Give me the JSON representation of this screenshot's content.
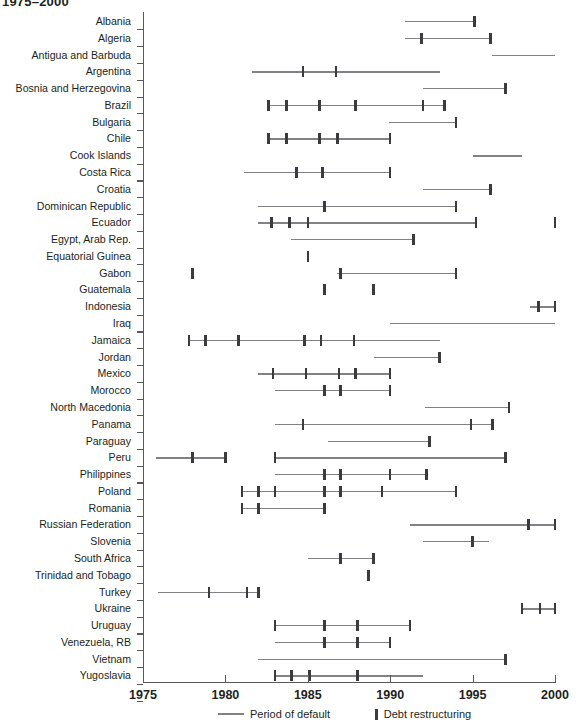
{
  "chart_title": "1975–2000",
  "legend": {
    "period_label": "Period of default",
    "restructuring_label": "Debt restructuring",
    "period_color": "#808285",
    "restructuring_color": "#3b3b3d"
  },
  "axis": {
    "x_label": "",
    "y_label": "",
    "x_ticks": [
      "1975",
      "1980",
      "1985",
      "1990",
      "1995",
      "2000"
    ],
    "x_min": 1975,
    "x_max": 2000
  },
  "chart_data": {
    "type": "timeline",
    "title": "1975–2000",
    "xlabel": "",
    "ylabel": "",
    "xlim": [
      1975,
      2000
    ],
    "grid": false,
    "legend_position": "bottom",
    "series": [
      {
        "name": "Period of default",
        "style": "line",
        "color": "#808285"
      },
      {
        "name": "Debt restructuring",
        "style": "marker",
        "color": "#3b3b3d"
      }
    ],
    "categories": [
      "Albania",
      "Algeria",
      "Antigua and Barbuda",
      "Argentina",
      "Bosnia and Herzegovina",
      "Brazil",
      "Bulgaria",
      "Chile",
      "Cook Islands",
      "Costa Rica",
      "Croatia",
      "Dominican Republic",
      "Ecuador",
      "Egypt, Arab Rep.",
      "Equatorial Guinea",
      "Gabon",
      "Guatemala",
      "Indonesia",
      "Iraq",
      "Jamaica",
      "Jordan",
      "Mexico",
      "Morocco",
      "North Macedonia",
      "Panama",
      "Paraguay",
      "Peru",
      "Philippines",
      "Poland",
      "Romania",
      "Russian Federation",
      "Slovenia",
      "South Africa",
      "Trinidad and Tobago",
      "Turkey",
      "Ukraine",
      "Uruguay",
      "Venezuela, RB",
      "Vietnam",
      "Yugoslavia"
    ],
    "rows": [
      {
        "country": "Albania",
        "periods": [
          [
            1990.9,
            1995.1
          ]
        ],
        "restructurings": [
          1995.1
        ]
      },
      {
        "country": "Algeria",
        "periods": [
          [
            1990.9,
            1996.1
          ]
        ],
        "restructurings": [
          1991.9,
          1996.1
        ]
      },
      {
        "country": "Antigua and Barbuda",
        "periods": [
          [
            1996.2,
            2000.0
          ]
        ],
        "restructurings": []
      },
      {
        "country": "Argentina",
        "periods": [
          [
            1981.6,
            1993.0
          ]
        ],
        "restructurings": [
          1984.7,
          1986.7
        ]
      },
      {
        "country": "Bosnia and Herzegovina",
        "periods": [
          [
            1992.0,
            1997.0
          ]
        ],
        "restructurings": [
          1997.0
        ]
      },
      {
        "country": "Brazil",
        "periods": [
          [
            1982.6,
            1993.3
          ]
        ],
        "restructurings": [
          1982.6,
          1983.7,
          1985.7,
          1987.9,
          1992.0,
          1993.3
        ]
      },
      {
        "country": "Bulgaria",
        "periods": [
          [
            1989.9,
            1994.0
          ]
        ],
        "restructurings": [
          1994.0
        ]
      },
      {
        "country": "Chile",
        "periods": [
          [
            1982.6,
            1990.0
          ]
        ],
        "restructurings": [
          1982.6,
          1983.7,
          1985.7,
          1986.8,
          1990.0
        ]
      },
      {
        "country": "Cook Islands",
        "periods": [
          [
            1995.0,
            1998.0
          ]
        ],
        "restructurings": []
      },
      {
        "country": "Costa Rica",
        "periods": [
          [
            1981.1,
            1990.0
          ]
        ],
        "restructurings": [
          1984.3,
          1985.9,
          1990.0
        ]
      },
      {
        "country": "Croatia",
        "periods": [
          [
            1992.0,
            1996.1
          ]
        ],
        "restructurings": [
          1996.1
        ]
      },
      {
        "country": "Dominican Republic",
        "periods": [
          [
            1982.0,
            1994.0
          ]
        ],
        "restructurings": [
          1986.0,
          1994.0
        ]
      },
      {
        "country": "Ecuador",
        "periods": [
          [
            1982.0,
            1995.2
          ]
        ],
        "restructurings": [
          1982.8,
          1983.9,
          1985.0,
          1995.2,
          2000.0
        ]
      },
      {
        "country": "Egypt, Arab Rep.",
        "periods": [
          [
            1984.0,
            1991.4
          ]
        ],
        "restructurings": [
          1991.4
        ]
      },
      {
        "country": "Equatorial Guinea",
        "periods": [],
        "restructurings": [
          1985.0
        ]
      },
      {
        "country": "Gabon",
        "periods": [
          [
            1986.8,
            1994.0
          ]
        ],
        "restructurings": [
          1978.0,
          1987.0,
          1994.0
        ]
      },
      {
        "country": "Guatemala",
        "periods": [],
        "restructurings": [
          1986.0,
          1989.0
        ]
      },
      {
        "country": "Indonesia",
        "periods": [
          [
            1998.5,
            2000.0
          ]
        ],
        "restructurings": [
          1999.0,
          2000.0
        ]
      },
      {
        "country": "Iraq",
        "periods": [
          [
            1990.0,
            2000.0
          ]
        ],
        "restructurings": []
      },
      {
        "country": "Jamaica",
        "periods": [
          [
            1977.8,
            1993.0
          ]
        ],
        "restructurings": [
          1977.8,
          1978.8,
          1980.8,
          1984.8,
          1985.8,
          1987.8
        ]
      },
      {
        "country": "Jordan",
        "periods": [
          [
            1989.0,
            1993.0
          ]
        ],
        "restructurings": [
          1993.0
        ]
      },
      {
        "country": "Mexico",
        "periods": [
          [
            1982.0,
            1990.0
          ]
        ],
        "restructurings": [
          1982.9,
          1984.9,
          1986.9,
          1987.9,
          1990.0
        ]
      },
      {
        "country": "Morocco",
        "periods": [
          [
            1983.0,
            1990.0
          ]
        ],
        "restructurings": [
          1986.0,
          1987.0,
          1990.0
        ]
      },
      {
        "country": "North Macedonia",
        "periods": [
          [
            1992.1,
            1997.2
          ]
        ],
        "restructurings": [
          1997.2
        ]
      },
      {
        "country": "Panama",
        "periods": [
          [
            1983.0,
            1996.2
          ]
        ],
        "restructurings": [
          1984.7,
          1994.9,
          1996.2
        ]
      },
      {
        "country": "Paraguay",
        "periods": [
          [
            1986.2,
            1992.4
          ]
        ],
        "restructurings": [
          1992.4
        ]
      },
      {
        "country": "Peru",
        "periods": [
          [
            1975.8,
            1980.0
          ],
          [
            1983.0,
            1997.0
          ]
        ],
        "restructurings": [
          1978.0,
          1980.0,
          1983.0,
          1997.0
        ]
      },
      {
        "country": "Philippines",
        "periods": [
          [
            1983.0,
            1992.2
          ]
        ],
        "restructurings": [
          1986.0,
          1987.0,
          1990.0,
          1992.2
        ]
      },
      {
        "country": "Poland",
        "periods": [
          [
            1981.0,
            1994.0
          ]
        ],
        "restructurings": [
          1981.0,
          1982.0,
          1983.0,
          1986.0,
          1987.0,
          1989.5,
          1994.0
        ]
      },
      {
        "country": "Romania",
        "periods": [
          [
            1981.0,
            1986.0
          ]
        ],
        "restructurings": [
          1981.0,
          1982.0,
          1986.0
        ]
      },
      {
        "country": "Russian Federation",
        "periods": [
          [
            1991.2,
            2000.0
          ]
        ],
        "restructurings": [
          1998.4,
          2000.0
        ]
      },
      {
        "country": "Slovenia",
        "periods": [
          [
            1992.0,
            1996.0
          ]
        ],
        "restructurings": [
          1995.0
        ]
      },
      {
        "country": "South Africa",
        "periods": [
          [
            1985.0,
            1989.0
          ]
        ],
        "restructurings": [
          1987.0,
          1989.0
        ]
      },
      {
        "country": "Trinidad and Tobago",
        "periods": [],
        "restructurings": [
          1988.7
        ]
      },
      {
        "country": "Turkey",
        "periods": [
          [
            1975.9,
            1982.0
          ]
        ],
        "restructurings": [
          1979.0,
          1981.3,
          1982.0
        ]
      },
      {
        "country": "Ukraine",
        "periods": [
          [
            1998.0,
            2000.0
          ]
        ],
        "restructurings": [
          1998.0,
          1999.1,
          2000.0
        ]
      },
      {
        "country": "Uruguay",
        "periods": [
          [
            1983.0,
            1991.2
          ]
        ],
        "restructurings": [
          1983.0,
          1986.0,
          1988.0,
          1991.2
        ]
      },
      {
        "country": "Venezuela, RB",
        "periods": [
          [
            1983.0,
            1990.0
          ]
        ],
        "restructurings": [
          1986.0,
          1988.0,
          1990.0
        ]
      },
      {
        "country": "Vietnam",
        "periods": [
          [
            1982.0,
            1997.0
          ]
        ],
        "restructurings": [
          1997.0
        ]
      },
      {
        "country": "Yugoslavia",
        "periods": [
          [
            1983.0,
            1992.0
          ]
        ],
        "restructurings": [
          1983.0,
          1984.0,
          1985.1,
          1988.0
        ]
      }
    ]
  }
}
